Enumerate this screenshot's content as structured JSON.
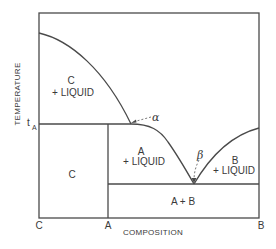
{
  "diagram": {
    "type": "binary-phase-diagram",
    "axes": {
      "x_label": "COMPOSITION",
      "y_label": "TEMPERATURE",
      "x_ticks": [
        "C",
        "A",
        "B"
      ],
      "y_ticks": [
        "t"
      ],
      "y_tick_subscript": "A"
    },
    "regions": {
      "c_liquid": {
        "line1": "C",
        "line2": "+ LIQUID"
      },
      "c_solid": {
        "line1": "C"
      },
      "a_liquid": {
        "line1": "A",
        "line2": "+ LIQUID"
      },
      "b_liquid": {
        "line1": "B",
        "line2": "+ LIQUID"
      },
      "a_plus_b": {
        "line1": "A + B"
      }
    },
    "annotations": {
      "alpha": "α",
      "beta": "β"
    },
    "colors": {
      "line": "#4a4a4a",
      "text": "#3a3a3a",
      "background": "#ffffff"
    }
  }
}
